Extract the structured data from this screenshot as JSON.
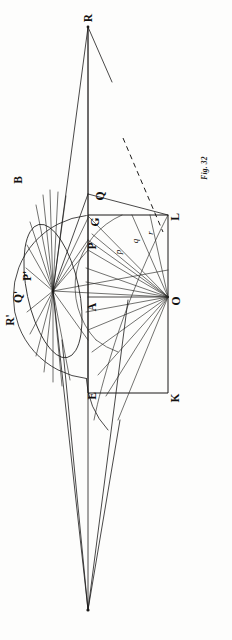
{
  "figure": {
    "caption": "Fig. 32",
    "orientation": "rotated-90",
    "background_color": "#fdfdfc",
    "ink_color": "#1c1b1a"
  },
  "labels": {
    "apex_top": "R",
    "ellipse_top": "B",
    "upper_vertex": "Q",
    "rect_corner_top_left": "G",
    "aperture_upper": "P",
    "rect_corner_top_right": "L",
    "axis_point": "A",
    "center_right": "O",
    "rect_corner_bottom_left": "E",
    "rect_corner_bottom_right": "K",
    "mirror_p": "P'",
    "mirror_q": "Q'",
    "mirror_r": "R'",
    "ray_p": "p",
    "ray_q": "q",
    "ray_r": "r"
  },
  "geometry": {
    "apex_top": [
      88,
      27
    ],
    "apex_bottom": [
      88,
      610
    ],
    "fan_center": [
      53,
      291
    ],
    "point_O": [
      168,
      297
    ],
    "point_A": [
      88,
      297
    ],
    "rect": {
      "left_x": 88,
      "right_x": 168,
      "top_y": 215,
      "bottom_y": 393
    },
    "ellipse": {
      "cx": 53,
      "cy": 291,
      "rx": 26,
      "ry": 68,
      "rotation_deg": -12
    },
    "arc_radius_outer": 82,
    "arc_radius_inner": 46
  },
  "label_positions": {
    "R": [
      92,
      18
    ],
    "B": [
      22,
      180
    ],
    "Q": [
      102,
      196
    ],
    "G": [
      99,
      220
    ],
    "P": [
      96,
      243
    ],
    "L": [
      178,
      216
    ],
    "A": [
      95,
      303
    ],
    "O": [
      179,
      300
    ],
    "E": [
      95,
      392
    ],
    "K": [
      178,
      394
    ],
    "Pp": [
      30,
      275
    ],
    "Qp": [
      22,
      295
    ],
    "Rp": [
      14,
      317
    ],
    "p": [
      122,
      250
    ],
    "q": [
      139,
      240
    ],
    "r": [
      154,
      232
    ],
    "caption": [
      205,
      168
    ]
  }
}
